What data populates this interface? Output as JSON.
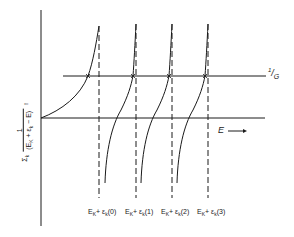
{
  "diagram": {
    "type": "graphical-solution-plot",
    "y_axis": {
      "label_sum": "Σ",
      "label_sum_index": "k",
      "label_numerator": "1",
      "label_denominator": "(E_K + ε_k − E)",
      "label_den_E": "E",
      "label_den_K": "K",
      "label_den_plus": " + ε",
      "label_den_k": "k",
      "label_den_tail": " − E)",
      "label_den_open": "(",
      "arrow": "↑"
    },
    "x_axis": {
      "label": "E",
      "arrow": "⟶"
    },
    "horizontal_line": {
      "label_num": "1",
      "label_den": "G",
      "label": "1/G"
    },
    "asymptotes": [
      {
        "id": 0,
        "label_E": "E",
        "label_K": "K",
        "label_mid": "+ ε",
        "label_k": "k",
        "label_index": "(0)",
        "x": 99
      },
      {
        "id": 1,
        "label_E": "E",
        "label_K": "K",
        "label_mid": "+ ε",
        "label_k": "k",
        "label_index": "(1)",
        "x": 136
      },
      {
        "id": 2,
        "label_E": "E",
        "label_K": "K",
        "label_mid": "+ ε",
        "label_k": "k",
        "label_index": "(2)",
        "x": 172
      },
      {
        "id": 3,
        "label_E": "E",
        "label_K": "K",
        "label_mid": "+ ε",
        "label_k": "k",
        "label_index": "(3)",
        "x": 208
      }
    ],
    "colors": {
      "ink": "#1a1a1a",
      "background": "#ffffff"
    }
  }
}
